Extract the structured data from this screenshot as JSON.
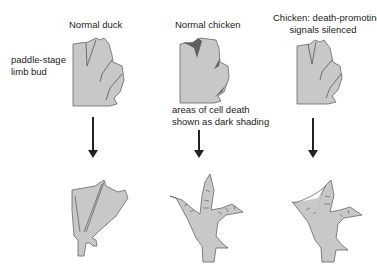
{
  "columns": [
    {
      "title": "Normal duck"
    },
    {
      "title": "Normal chicken"
    },
    {
      "title_line1": "Chicken: death-promoting",
      "title_line2": "signals silenced"
    }
  ],
  "side_label": {
    "line1": "paddle-stage",
    "line2": "limb bud"
  },
  "annotation": {
    "line1": "areas of cell death",
    "line2": "shown as dark shading"
  },
  "colors": {
    "tissue": "#c8c8c8",
    "outline": "#555555",
    "cell_death": "#606060",
    "arrow": "#222222"
  }
}
